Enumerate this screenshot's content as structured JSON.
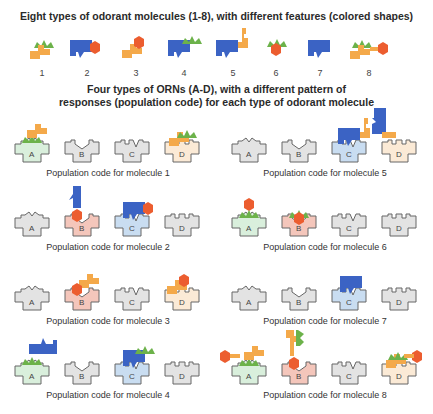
{
  "title_top": "Eight types of odorant molecules (1-8), with different features (colored shapes)",
  "title_mid_1": "Four types of ORNs (A-D), with a different pattern of",
  "title_mid_2": "responses (population code) for each type of odorant molecule",
  "colors": {
    "green": "#6cb24a",
    "orange": "#f4a94a",
    "blue": "#3b63c4",
    "red": "#ec5d2f",
    "receptor_inactive_fill": "#e3e3e3",
    "receptor_A_fill": "#d9efdc",
    "receptor_B_fill": "#f4c6bb",
    "receptor_C_fill": "#c9ddf1",
    "receptor_D_fill": "#fbead6",
    "stroke": "#666666"
  },
  "molecules": [
    {
      "label": "1",
      "features": [
        "green",
        "orange"
      ]
    },
    {
      "label": "2",
      "features": [
        "blue",
        "red"
      ]
    },
    {
      "label": "3",
      "features": [
        "orange",
        "red"
      ]
    },
    {
      "label": "4",
      "features": [
        "blue",
        "green"
      ]
    },
    {
      "label": "5",
      "features": [
        "blue",
        "orange"
      ]
    },
    {
      "label": "6",
      "features": [
        "green",
        "red"
      ]
    },
    {
      "label": "7",
      "features": [
        "blue"
      ]
    },
    {
      "label": "8",
      "features": [
        "green",
        "orange",
        "red"
      ]
    }
  ],
  "receptors": [
    "A",
    "B",
    "C",
    "D"
  ],
  "population_codes": [
    {
      "caption": "Population code for molecule 1",
      "active": [
        "A",
        "D"
      ]
    },
    {
      "caption": "Population code for molecule 2",
      "active": [
        "B",
        "C"
      ]
    },
    {
      "caption": "Population code for molecule 3",
      "active": [
        "B",
        "D"
      ]
    },
    {
      "caption": "Population code for molecule 4",
      "active": [
        "A",
        "C"
      ]
    },
    {
      "caption": "Population code for molecule 5",
      "active": [
        "C",
        "D"
      ]
    },
    {
      "caption": "Population code for molecule 6",
      "active": [
        "A",
        "B"
      ]
    },
    {
      "caption": "Population code for molecule 7",
      "active": [
        "C"
      ]
    },
    {
      "caption": "Population code for molecule 8",
      "active": [
        "A",
        "B",
        "D"
      ]
    }
  ]
}
